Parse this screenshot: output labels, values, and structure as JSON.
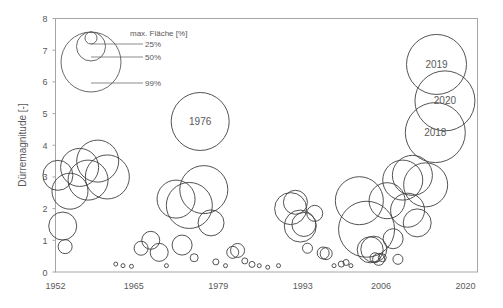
{
  "chart_data": {
    "type": "scatter",
    "title": "",
    "xlabel": "",
    "ylabel": "Dürremagnitude [-]",
    "xlim": [
      1952,
      2022
    ],
    "ylim": [
      0,
      8
    ],
    "xticks": [
      "1952",
      "1965",
      "1979",
      "1993",
      "2006",
      "2020"
    ],
    "xtick_values": [
      1952,
      1965,
      1979,
      1993,
      2006,
      2020
    ],
    "yticks": [
      "0",
      "1",
      "2",
      "3",
      "4",
      "5",
      "6",
      "7",
      "8"
    ],
    "ytick_values": [
      0,
      1,
      2,
      3,
      4,
      5,
      6,
      7,
      8
    ],
    "grid": false,
    "legend_position": "top-left",
    "size_variable": "max. Fläche [%]",
    "marker_style": "open-circle",
    "marker_color": "#404040",
    "points": [
      {
        "x": 1952.4,
        "y": 3.05,
        "r": 15
      },
      {
        "x": 1953.2,
        "y": 1.45,
        "r": 14
      },
      {
        "x": 1953.6,
        "y": 0.8,
        "r": 7
      },
      {
        "x": 1954.4,
        "y": 2.55,
        "r": 18
      },
      {
        "x": 1956.0,
        "y": 3.3,
        "r": 19
      },
      {
        "x": 1957.4,
        "y": 2.9,
        "r": 20
      },
      {
        "x": 1959.0,
        "y": 3.5,
        "r": 21
      },
      {
        "x": 1960.6,
        "y": 3.0,
        "r": 22
      },
      {
        "x": 1962.0,
        "y": 0.25,
        "r": 2
      },
      {
        "x": 1963.2,
        "y": 0.2,
        "r": 2
      },
      {
        "x": 1964.6,
        "y": 0.18,
        "r": 2
      },
      {
        "x": 1966.2,
        "y": 0.75,
        "r": 7
      },
      {
        "x": 1967.8,
        "y": 1.0,
        "r": 9
      },
      {
        "x": 1969.2,
        "y": 0.62,
        "r": 9
      },
      {
        "x": 1970.4,
        "y": 0.2,
        "r": 2
      },
      {
        "x": 1972.0,
        "y": 2.3,
        "r": 19
      },
      {
        "x": 1973.0,
        "y": 0.85,
        "r": 10
      },
      {
        "x": 1974.2,
        "y": 2.1,
        "r": 23
      },
      {
        "x": 1975.0,
        "y": 0.45,
        "r": 4
      },
      {
        "x": 1976.0,
        "y": 4.75,
        "r": 29,
        "label": "1976"
      },
      {
        "x": 1976.6,
        "y": 2.6,
        "r": 24
      },
      {
        "x": 1977.8,
        "y": 1.55,
        "r": 13
      },
      {
        "x": 1978.6,
        "y": 0.32,
        "r": 3
      },
      {
        "x": 1980.2,
        "y": 0.2,
        "r": 2
      },
      {
        "x": 1981.4,
        "y": 0.62,
        "r": 6
      },
      {
        "x": 1982.2,
        "y": 0.68,
        "r": 7
      },
      {
        "x": 1983.4,
        "y": 0.35,
        "r": 3
      },
      {
        "x": 1984.6,
        "y": 0.24,
        "r": 3
      },
      {
        "x": 1985.8,
        "y": 0.2,
        "r": 2
      },
      {
        "x": 1987.2,
        "y": 0.15,
        "r": 2
      },
      {
        "x": 1989.0,
        "y": 0.2,
        "r": 2
      },
      {
        "x": 1991.0,
        "y": 2.0,
        "r": 16
      },
      {
        "x": 1991.8,
        "y": 2.2,
        "r": 12
      },
      {
        "x": 1992.6,
        "y": 1.45,
        "r": 16
      },
      {
        "x": 1993.2,
        "y": 1.5,
        "r": 12
      },
      {
        "x": 1993.8,
        "y": 0.75,
        "r": 5
      },
      {
        "x": 1995.0,
        "y": 1.85,
        "r": 8
      },
      {
        "x": 1996.4,
        "y": 0.6,
        "r": 6
      },
      {
        "x": 1996.9,
        "y": 0.58,
        "r": 6
      },
      {
        "x": 1998.2,
        "y": 0.2,
        "r": 2
      },
      {
        "x": 1999.4,
        "y": 0.25,
        "r": 3
      },
      {
        "x": 2000.2,
        "y": 0.3,
        "r": 3
      },
      {
        "x": 2001.0,
        "y": 0.2,
        "r": 2
      },
      {
        "x": 2002.4,
        "y": 2.25,
        "r": 24
      },
      {
        "x": 2003.6,
        "y": 1.35,
        "r": 28
      },
      {
        "x": 2004.2,
        "y": 0.7,
        "r": 13
      },
      {
        "x": 2004.8,
        "y": 0.72,
        "r": 13
      },
      {
        "x": 2005.0,
        "y": 0.45,
        "r": 5
      },
      {
        "x": 2005.6,
        "y": 0.4,
        "r": 6
      },
      {
        "x": 2006.2,
        "y": 0.45,
        "r": 4
      },
      {
        "x": 2007.0,
        "y": 2.25,
        "r": 18
      },
      {
        "x": 2008.0,
        "y": 1.05,
        "r": 10
      },
      {
        "x": 2008.8,
        "y": 0.4,
        "r": 5
      },
      {
        "x": 2009.6,
        "y": 2.9,
        "r": 20
      },
      {
        "x": 2010.4,
        "y": 1.95,
        "r": 17
      },
      {
        "x": 2011.2,
        "y": 3.05,
        "r": 20
      },
      {
        "x": 2012.0,
        "y": 1.55,
        "r": 14
      },
      {
        "x": 2013.4,
        "y": 2.75,
        "r": 22
      },
      {
        "x": 2015.2,
        "y": 6.55,
        "r": 30,
        "label": "2019"
      },
      {
        "x": 2016.6,
        "y": 5.4,
        "r": 30,
        "label": "2020"
      },
      {
        "x": 2015.0,
        "y": 4.4,
        "r": 30,
        "label": "2018"
      }
    ]
  },
  "legend": {
    "title": "max. Fläche [%]",
    "entries": [
      {
        "label": "25%"
      },
      {
        "label": "50%"
      },
      {
        "label": "99%"
      }
    ]
  }
}
